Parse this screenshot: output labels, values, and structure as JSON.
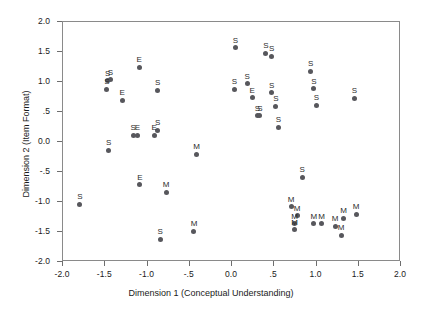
{
  "chart_data": {
    "type": "scatter",
    "title": "",
    "xlabel": "Dimension 1 (Conceptual Understanding)",
    "ylabel": "Dimension 2 (Item Format)",
    "xlim": [
      -2.0,
      2.0
    ],
    "ylim": [
      -2.0,
      2.0
    ],
    "grid": false,
    "legend": "none",
    "xticks": [
      "-2.0",
      "-1.5",
      "-1.0",
      "-.5",
      "0.0",
      ".5",
      "1.0",
      "1.5",
      "2.0"
    ],
    "xtick_values": [
      -2.0,
      -1.5,
      -1.0,
      -0.5,
      0.0,
      0.5,
      1.0,
      1.5,
      2.0
    ],
    "yticks": [
      "2.0",
      "1.5",
      "1.0",
      ".5",
      "0.0",
      "-.5",
      "-1.0",
      "-1.5",
      "-2.0"
    ],
    "ytick_values": [
      2.0,
      1.5,
      1.0,
      0.5,
      0.0,
      -0.5,
      -1.0,
      -1.5,
      -2.0
    ],
    "point_color": "#57575c",
    "points": [
      {
        "x": -1.47,
        "y": 1.02,
        "label": "S"
      },
      {
        "x": -1.44,
        "y": 1.04,
        "label": "S"
      },
      {
        "x": -1.48,
        "y": 0.88,
        "label": "S"
      },
      {
        "x": -1.3,
        "y": 0.7,
        "label": "E"
      },
      {
        "x": -1.1,
        "y": 1.25,
        "label": "E"
      },
      {
        "x": -0.88,
        "y": 0.86,
        "label": "S"
      },
      {
        "x": -1.46,
        "y": -0.14,
        "label": "S"
      },
      {
        "x": -1.17,
        "y": 0.11,
        "label": "S"
      },
      {
        "x": -1.12,
        "y": 0.11,
        "label": "E"
      },
      {
        "x": -0.88,
        "y": 0.2,
        "label": "S"
      },
      {
        "x": -0.92,
        "y": 0.11,
        "label": "E"
      },
      {
        "x": -1.8,
        "y": -1.04,
        "label": "S"
      },
      {
        "x": -1.09,
        "y": -0.71,
        "label": "E"
      },
      {
        "x": -0.78,
        "y": -0.84,
        "label": "M"
      },
      {
        "x": -0.85,
        "y": -1.62,
        "label": "S"
      },
      {
        "x": -0.45,
        "y": -1.49,
        "label": "M"
      },
      {
        "x": -0.42,
        "y": -0.2,
        "label": "M"
      },
      {
        "x": 0.04,
        "y": 1.57,
        "label": "S"
      },
      {
        "x": 0.03,
        "y": 0.88,
        "label": "S"
      },
      {
        "x": 0.18,
        "y": 0.97,
        "label": "S"
      },
      {
        "x": 0.24,
        "y": 0.74,
        "label": "E"
      },
      {
        "x": 0.3,
        "y": 0.44,
        "label": "S"
      },
      {
        "x": 0.33,
        "y": 0.44,
        "label": "S"
      },
      {
        "x": 0.4,
        "y": 1.48,
        "label": "S"
      },
      {
        "x": 0.47,
        "y": 1.43,
        "label": "S"
      },
      {
        "x": 0.47,
        "y": 0.82,
        "label": "S"
      },
      {
        "x": 0.52,
        "y": 0.6,
        "label": "S"
      },
      {
        "x": 0.55,
        "y": 0.25,
        "label": "S"
      },
      {
        "x": 0.93,
        "y": 1.18,
        "label": "S"
      },
      {
        "x": 0.97,
        "y": 0.89,
        "label": "S"
      },
      {
        "x": 1.0,
        "y": 0.61,
        "label": "S"
      },
      {
        "x": 1.45,
        "y": 0.73,
        "label": "S"
      },
      {
        "x": 0.83,
        "y": -0.59,
        "label": "S"
      },
      {
        "x": 0.7,
        "y": -1.08,
        "label": "M"
      },
      {
        "x": 0.77,
        "y": -1.23,
        "label": "M"
      },
      {
        "x": 0.74,
        "y": -1.36,
        "label": "M"
      },
      {
        "x": 0.74,
        "y": -1.46,
        "label": "M"
      },
      {
        "x": 0.97,
        "y": -1.36,
        "label": "M"
      },
      {
        "x": 1.06,
        "y": -1.36,
        "label": "M"
      },
      {
        "x": 1.22,
        "y": -1.4,
        "label": "M"
      },
      {
        "x": 1.29,
        "y": -1.55,
        "label": "M"
      },
      {
        "x": 1.32,
        "y": -1.27,
        "label": "M"
      },
      {
        "x": 1.47,
        "y": -1.2,
        "label": "M"
      }
    ]
  }
}
